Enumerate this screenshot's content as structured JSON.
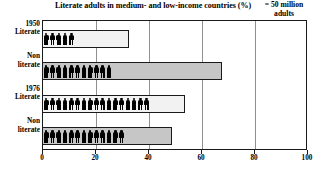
{
  "chart_data": {
    "type": "bar",
    "title": "Literate adults in medium- and low-income countries (%)",
    "xlabel": "",
    "ylabel": "",
    "xlim": [
      0,
      100
    ],
    "xticks": [
      0,
      20,
      40,
      60,
      80,
      100
    ],
    "xtick_labels": [
      "0",
      "20",
      "40",
      "60",
      "80",
      "100"
    ],
    "grid": true,
    "grid_axis": "x",
    "legend_position": "top-right",
    "legend": {
      "line1": "= 50 million",
      "line2": "adults",
      "symbol": "person-pictogram",
      "unit_value_millions": 50
    },
    "categories": [
      "1950 Literate",
      "1950 Non literate",
      "1976 Literate",
      "1976 Non literate"
    ],
    "values": [
      33,
      68,
      54,
      49
    ],
    "pictogram_counts": [
      5,
      11,
      17,
      13
    ],
    "bars": [
      {
        "group": "1950",
        "label_line1": "1950",
        "label_line2": "Literate",
        "value": 33,
        "fill": "light",
        "fill_color": "#f2f2f2",
        "pictograms": 5,
        "adults_millions": 250
      },
      {
        "group": "1950",
        "label_line1": "Non",
        "label_line2": "literate",
        "value": 68,
        "fill": "dark",
        "fill_color": "#c6c6c6",
        "pictograms": 11,
        "adults_millions": 550
      },
      {
        "group": "1976",
        "label_line1": "1976",
        "label_line2": "Literate",
        "value": 54,
        "fill": "light",
        "fill_color": "#f2f2f2",
        "pictograms": 17,
        "adults_millions": 850
      },
      {
        "group": "1976",
        "label_line1": "Non",
        "label_line2": "literate",
        "value": 49,
        "fill": "dark",
        "fill_color": "#c6c6c6",
        "pictograms": 13,
        "adults_millions": 650
      }
    ],
    "colors": {
      "bar_light": "#f2f2f2",
      "bar_dark": "#c6c6c6",
      "outline": "#1a1a1a",
      "gridline": "#8f8f8f",
      "pictogram": "#000000",
      "background": "#ffffff"
    }
  }
}
